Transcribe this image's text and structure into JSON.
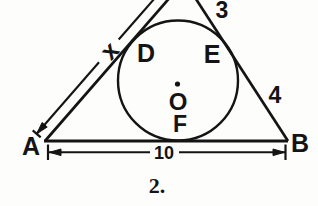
{
  "figure": {
    "caption": "2.",
    "colors": {
      "ink": "#141414",
      "background": "#fdfdfc"
    },
    "labels": {
      "vertex_a": "A",
      "vertex_b": "B",
      "tangent_left": "D",
      "tangent_right": "E",
      "center": "O",
      "tangent_bottom": "F"
    },
    "measurements": {
      "upper_right_side": "3",
      "lower_right_side": "4",
      "left_side_unknown": "x",
      "base": "10"
    }
  }
}
